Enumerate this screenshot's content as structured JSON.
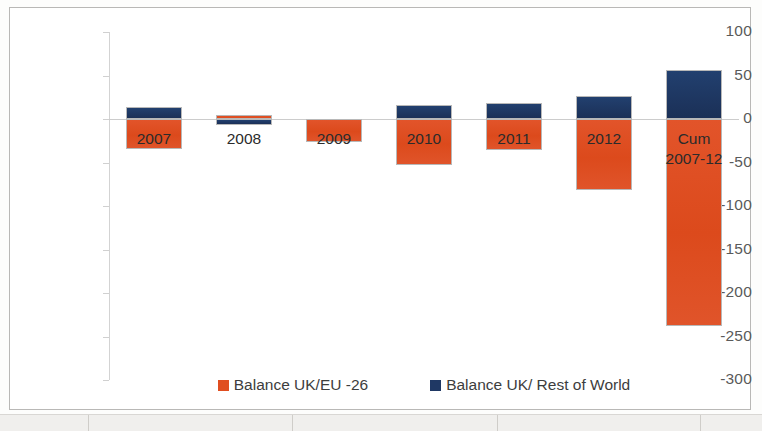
{
  "chart_data": {
    "type": "bar",
    "title": "",
    "subtitle": "",
    "xlabel": "",
    "ylabel": "",
    "stacked": false,
    "grid": false,
    "legend_position": "bottom",
    "ylim": [
      -300,
      100
    ],
    "y_ticks": [
      100,
      50,
      0,
      -50,
      -100,
      -150,
      -200,
      -250,
      -300
    ],
    "y_tick_labels": [
      "100",
      "50",
      "0",
      "-50",
      "-100",
      "-150",
      "-200",
      "-250",
      "-300"
    ],
    "categories": [
      "2007",
      "2008",
      "2009",
      "2010",
      "2011",
      "2012",
      "Cum\n2007-12"
    ],
    "series": [
      {
        "name": "Balance UK/EU -26",
        "color": "#e04e20",
        "values": [
          -35,
          5,
          -27,
          -53,
          -36,
          -82,
          -238
        ]
      },
      {
        "name": "Balance UK/ Rest of World",
        "color": "#1f3864",
        "values": [
          14,
          -7,
          0,
          16,
          18,
          27,
          56
        ]
      }
    ]
  },
  "legend": {
    "items": [
      {
        "label": "Balance UK/EU -26",
        "color": "#e04e20",
        "swatch": "eu"
      },
      {
        "label": "Balance UK/ Rest of World",
        "color": "#1f3864",
        "swatch": "row"
      }
    ]
  },
  "colors": {
    "eu": "#e04e20",
    "rest_of_world": "#1f3864",
    "axis": "#d3d3d3",
    "tick_text": "#5a5a5a",
    "frame": "#b9b8b6"
  }
}
